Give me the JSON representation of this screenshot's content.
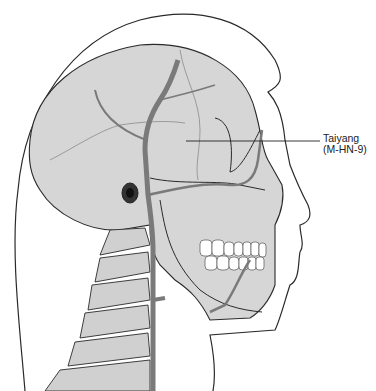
{
  "figure": {
    "label": {
      "name": "Taiyang",
      "code": "(M-HN-9)"
    },
    "colors": {
      "outline": "#2a2a2a",
      "skull_fill": "#d6d6d6",
      "artery": "#7a7a7a",
      "teeth": "#ffffff",
      "background": "#ffffff"
    }
  }
}
